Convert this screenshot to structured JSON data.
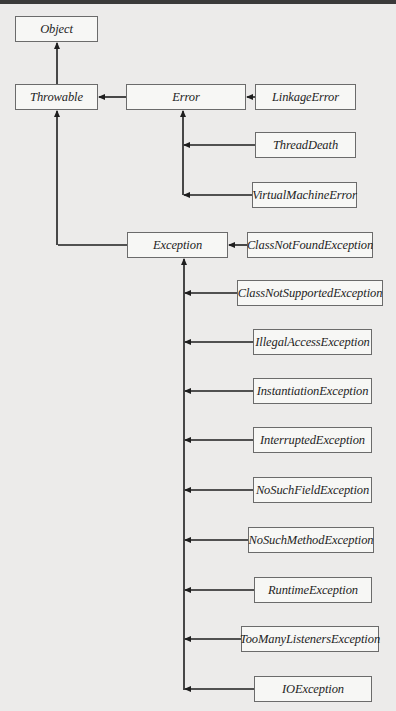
{
  "diagram": {
    "title": "",
    "nodes": [
      {
        "id": "object",
        "label": "Object",
        "x": 15,
        "y": 16,
        "w": 83,
        "h": 26
      },
      {
        "id": "throwable",
        "label": "Throwable",
        "x": 15,
        "y": 84,
        "w": 83,
        "h": 26
      },
      {
        "id": "error",
        "label": "Error",
        "x": 126,
        "y": 84,
        "w": 120,
        "h": 26
      },
      {
        "id": "linkage-error",
        "label": "LinkageError",
        "x": 255,
        "y": 84,
        "w": 101,
        "h": 26
      },
      {
        "id": "thread-death",
        "label": "ThreadDeath",
        "x": 255,
        "y": 132,
        "w": 101,
        "h": 26
      },
      {
        "id": "virtual-machine-error",
        "label": "VirtualMachineError",
        "x": 252,
        "y": 182,
        "w": 105,
        "h": 26
      },
      {
        "id": "exception",
        "label": "Exception",
        "x": 127,
        "y": 232,
        "w": 101,
        "h": 26
      },
      {
        "id": "class-not-found-exception",
        "label": "ClassNotFoundException",
        "x": 247,
        "y": 232,
        "w": 126,
        "h": 26
      },
      {
        "id": "class-not-supported-exception",
        "label": "ClassNotSupportedException",
        "x": 237,
        "y": 280,
        "w": 146,
        "h": 26
      },
      {
        "id": "illegal-access-exception",
        "label": "IllegalAccessException",
        "x": 253,
        "y": 329,
        "w": 119,
        "h": 26
      },
      {
        "id": "instantiation-exception",
        "label": "InstantiationException",
        "x": 253,
        "y": 378,
        "w": 119,
        "h": 26
      },
      {
        "id": "interrupted-exception",
        "label": "InterruptedException",
        "x": 253,
        "y": 427,
        "w": 119,
        "h": 26
      },
      {
        "id": "no-such-field-exception",
        "label": "NoSuchFieldException",
        "x": 253,
        "y": 477,
        "w": 119,
        "h": 26
      },
      {
        "id": "no-such-method-exception",
        "label": "NoSuchMethodException",
        "x": 248,
        "y": 527,
        "w": 126,
        "h": 26
      },
      {
        "id": "runtime-exception",
        "label": "RuntimeException",
        "x": 254,
        "y": 577,
        "w": 118,
        "h": 26
      },
      {
        "id": "too-many-listeners-exception",
        "label": "TooManyListenersException",
        "x": 241,
        "y": 626,
        "w": 138,
        "h": 26
      },
      {
        "id": "io-exception",
        "label": "IOException",
        "x": 254,
        "y": 676,
        "w": 118,
        "h": 26
      }
    ],
    "edges": [
      {
        "from": "throwable",
        "to": "object"
      },
      {
        "from": "error",
        "to": "throwable"
      },
      {
        "from": "exception",
        "to": "throwable"
      },
      {
        "from": "linkage-error",
        "to": "error"
      },
      {
        "from": "thread-death",
        "to": "error"
      },
      {
        "from": "virtual-machine-error",
        "to": "error"
      },
      {
        "from": "class-not-found-exception",
        "to": "exception"
      },
      {
        "from": "class-not-supported-exception",
        "to": "exception"
      },
      {
        "from": "illegal-access-exception",
        "to": "exception"
      },
      {
        "from": "instantiation-exception",
        "to": "exception"
      },
      {
        "from": "interrupted-exception",
        "to": "exception"
      },
      {
        "from": "no-such-field-exception",
        "to": "exception"
      },
      {
        "from": "no-such-method-exception",
        "to": "exception"
      },
      {
        "from": "runtime-exception",
        "to": "exception"
      },
      {
        "from": "too-many-listeners-exception",
        "to": "exception"
      },
      {
        "from": "io-exception",
        "to": "exception"
      }
    ]
  },
  "colors": {
    "background": "#ecebea",
    "box_fill": "#f7f7f5",
    "box_border": "#6b6b6b",
    "line": "#1e1e1e"
  }
}
